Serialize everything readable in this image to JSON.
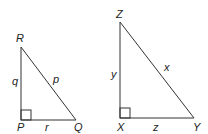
{
  "diagram": {
    "triangles": [
      {
        "name": "PQR",
        "vertices": {
          "top": "R",
          "right_angle": "P",
          "right": "Q"
        },
        "sides": {
          "vertical": "q",
          "hypotenuse": "p",
          "base": "r"
        }
      },
      {
        "name": "XYZ",
        "vertices": {
          "top": "Z",
          "right_angle": "X",
          "right": "Y"
        },
        "sides": {
          "vertical": "y",
          "hypotenuse": "x",
          "base": "z"
        }
      }
    ],
    "colors": {
      "line": "#333333",
      "text": "#222222",
      "background": "#ffffff"
    }
  }
}
